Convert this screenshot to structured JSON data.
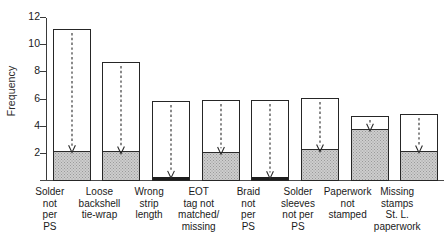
{
  "chart_data": {
    "type": "bar",
    "title": "",
    "subtitle": "",
    "xlabel": "",
    "ylabel": "Frequency",
    "ylim": [
      0,
      12.6
    ],
    "grid": false,
    "legend": null,
    "yticks": [
      2,
      4,
      6,
      8,
      10,
      12
    ],
    "ytick_labels": [
      "2",
      "4",
      "6",
      "8",
      "10",
      "12"
    ],
    "categories": [
      "Solder\nnot\nper\nPS",
      "Loose\nbackshell\ntie-wrap",
      "Wrong\nstrip\nlength",
      "EOT\ntag not\nmatched/\nmissing",
      "Braid\nnot\nper\nPS",
      "Solder\nsleeves\nnot per\nPS",
      "Paperwork\nnot\nstamped",
      "Missing\nstamps\nSt. L.\npaperwork"
    ],
    "series": [
      {
        "name": "Total frequency",
        "style": "outlined-bar",
        "values": [
          11.2,
          8.8,
          5.9,
          6.0,
          6.0,
          6.15,
          4.8,
          4.95
        ]
      },
      {
        "name": "Shaded (lower) portion",
        "style": "stippled-fill",
        "values": [
          2.1,
          2.05,
          0.2,
          2.0,
          0.2,
          2.2,
          3.7,
          2.1
        ]
      }
    ],
    "annotations": {
      "marker": "dashed-vertical-arrow-pointing-down",
      "marker_targets": [
        2.1,
        2.05,
        0.2,
        2.0,
        0.2,
        2.2,
        3.7,
        2.1
      ],
      "description": "A dashed vertical arrow descends from the top of each bar to the top of the shaded region."
    },
    "colors": {
      "bar_outline": "#262626",
      "bar_background": "#ffffff",
      "shaded_fill": "#cdcdcd",
      "shaded_fill_dots": "#9a9a9a",
      "sliver_fill": "#1d1d1d",
      "axis": "#3a3a3a",
      "text": "#1a1a1a",
      "arrow": "#2b2b2b"
    }
  }
}
